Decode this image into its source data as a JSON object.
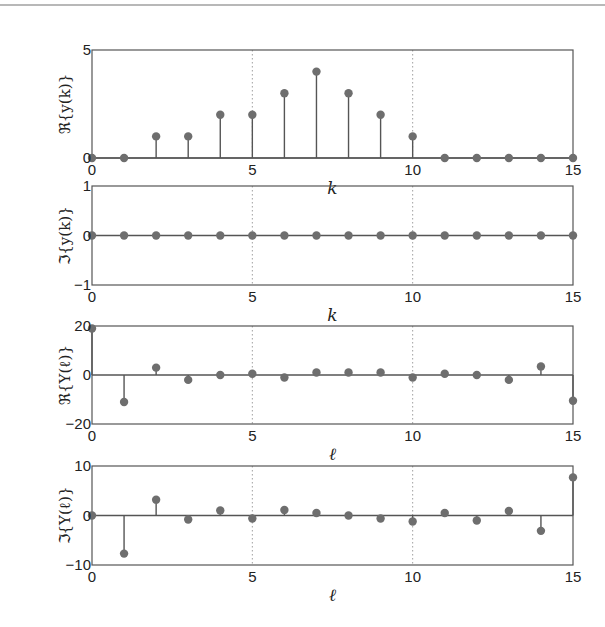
{
  "chart_data": [
    {
      "type": "stem",
      "ylabel": "ℜ{y(k)}",
      "xlabel": "k",
      "xlim": [
        0,
        15
      ],
      "ylim": [
        0,
        5
      ],
      "xticks": [
        0,
        5,
        10,
        15
      ],
      "yticks": [
        0,
        5
      ],
      "x": [
        0,
        1,
        2,
        3,
        4,
        5,
        6,
        7,
        8,
        9,
        10,
        11,
        12,
        13,
        14,
        15
      ],
      "values": [
        0,
        0,
        1,
        1,
        2,
        2,
        3,
        4,
        3,
        2,
        1,
        0,
        0,
        0,
        0,
        0
      ],
      "box": {
        "x0": 92,
        "x1": 573,
        "y0": 50,
        "y1": 158
      }
    },
    {
      "type": "stem",
      "ylabel": "ℑ{y(k)}",
      "xlabel": "k",
      "xlim": [
        0,
        15
      ],
      "ylim": [
        -1,
        1
      ],
      "xticks": [
        0,
        5,
        10,
        15
      ],
      "yticks": [
        -1,
        0,
        1
      ],
      "x": [
        0,
        1,
        2,
        3,
        4,
        5,
        6,
        7,
        8,
        9,
        10,
        11,
        12,
        13,
        14,
        15
      ],
      "values": [
        0,
        0,
        0,
        0,
        0,
        0,
        0,
        0,
        0,
        0,
        0,
        0,
        0,
        0,
        0,
        0
      ],
      "box": {
        "x0": 92,
        "x1": 573,
        "y0": 186,
        "y1": 285
      }
    },
    {
      "type": "stem",
      "ylabel": "ℜ{Y(ℓ)}",
      "xlabel": "ℓ",
      "xlim": [
        0,
        15
      ],
      "ylim": [
        -20,
        20
      ],
      "xticks": [
        0,
        5,
        10,
        15
      ],
      "yticks": [
        -20,
        0,
        20
      ],
      "x": [
        0,
        1,
        2,
        3,
        4,
        5,
        6,
        7,
        8,
        9,
        10,
        11,
        12,
        13,
        14,
        15
      ],
      "values": [
        19,
        -11,
        3,
        -2,
        0,
        0.5,
        -1,
        1,
        1,
        1,
        -1,
        0.5,
        0,
        -2,
        3.5,
        -10.5
      ],
      "box": {
        "x0": 92,
        "x1": 573,
        "y0": 326,
        "y1": 424
      }
    },
    {
      "type": "stem",
      "ylabel": "ℑ{Y(ℓ)}",
      "xlabel": "ℓ",
      "xlim": [
        0,
        15
      ],
      "ylim": [
        -10,
        10
      ],
      "xticks": [
        0,
        5,
        10,
        15
      ],
      "yticks": [
        -10,
        0,
        10
      ],
      "x": [
        0,
        1,
        2,
        3,
        4,
        5,
        6,
        7,
        8,
        9,
        10,
        11,
        12,
        13,
        14,
        15
      ],
      "values": [
        0,
        -7.7,
        3.2,
        -0.8,
        1.0,
        -0.6,
        1.1,
        0.5,
        0,
        -0.6,
        -1.2,
        0.5,
        -1.0,
        0.9,
        -3.1,
        7.7
      ],
      "box": {
        "x0": 92,
        "x1": 573,
        "y0": 466,
        "y1": 565
      }
    }
  ],
  "colors": {
    "marker": "#6e6e6e",
    "axis": "#555555",
    "grid": "#888888"
  }
}
